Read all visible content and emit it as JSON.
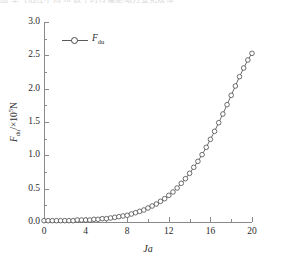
{
  "caption_strip": {
    "text": "图  单气泡在不同 Ja 数下的冷凝驱动力变化规律"
  },
  "legend": {
    "position": "top-left",
    "entries": [
      {
        "label_main": "F",
        "label_sub": "du",
        "marker": "open-circle",
        "line_color": "#5a5a5a"
      }
    ]
  },
  "axes": {
    "x": {
      "title": "Ja",
      "min": 0,
      "max": 20,
      "major_ticks": [
        0,
        4,
        8,
        12,
        16,
        20
      ],
      "minor_ticks": [
        2,
        6,
        10,
        14,
        18
      ],
      "tick_labels": [
        "0",
        "4",
        "8",
        "12",
        "16",
        "20"
      ]
    },
    "y": {
      "title_main": "F",
      "title_sub": "du",
      "title_unit": "/×10",
      "title_exp": "5",
      "title_tail": "N",
      "min": 0.0,
      "max": 3.0,
      "major_ticks": [
        0.0,
        0.5,
        1.0,
        1.5,
        2.0,
        2.5,
        3.0
      ],
      "minor_ticks": [
        0.25,
        0.75,
        1.25,
        1.75,
        2.25,
        2.75
      ],
      "tick_labels": [
        "0.0",
        "0.5",
        "1.0",
        "1.5",
        "2.0",
        "2.5",
        "3.0"
      ]
    }
  },
  "colors": {
    "axis": "#8a8a8a",
    "series_line": "#5a5a5a",
    "marker_stroke": "#4a4a4a",
    "marker_fill": "#ffffff",
    "text": "#2b2b2b",
    "background": "#ffffff"
  },
  "chart_data": {
    "type": "line",
    "title": "",
    "subtitle": "",
    "xlabel": "Ja",
    "ylabel": "F_du /×10^5 N",
    "xlim": [
      0,
      20
    ],
    "ylim": [
      0.0,
      3.0
    ],
    "grid": false,
    "legend_position": "top-left",
    "marker": "open-circle",
    "series": [
      {
        "name": "F_du",
        "x": [
          0.0,
          0.4,
          0.8,
          1.2,
          1.6,
          2.0,
          2.4,
          2.8,
          3.2,
          3.6,
          4.0,
          4.4,
          4.8,
          5.2,
          5.6,
          6.0,
          6.4,
          6.8,
          7.2,
          7.6,
          8.0,
          8.4,
          8.8,
          9.2,
          9.6,
          10.0,
          10.4,
          10.8,
          11.2,
          11.6,
          12.0,
          12.4,
          12.8,
          13.2,
          13.6,
          14.0,
          14.4,
          14.8,
          15.2,
          15.6,
          16.0,
          16.4,
          16.8,
          17.2,
          17.6,
          18.0,
          18.4,
          18.8,
          19.2,
          19.6,
          20.0
        ],
        "y": [
          0.02,
          0.02,
          0.02,
          0.02,
          0.02,
          0.02,
          0.02,
          0.02,
          0.03,
          0.03,
          0.03,
          0.03,
          0.04,
          0.04,
          0.05,
          0.05,
          0.06,
          0.07,
          0.08,
          0.09,
          0.1,
          0.12,
          0.14,
          0.16,
          0.18,
          0.21,
          0.24,
          0.27,
          0.31,
          0.35,
          0.4,
          0.45,
          0.51,
          0.58,
          0.65,
          0.73,
          0.82,
          0.91,
          1.01,
          1.12,
          1.24,
          1.36,
          1.49,
          1.62,
          1.76,
          1.9,
          2.04,
          2.18,
          2.31,
          2.43,
          2.53
        ]
      }
    ]
  }
}
